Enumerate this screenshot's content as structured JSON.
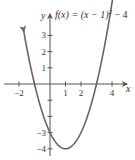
{
  "chart_data": {
    "type": "line",
    "title_parts": {
      "fx": "f(x) = (x − 1)",
      "exp": "2",
      "rest": " − 4"
    },
    "function": "(x - 1)^2 - 4",
    "xlabel": "x",
    "ylabel": "y",
    "x_ticks": [
      -2,
      1,
      2,
      4
    ],
    "x_tick_labels": [
      "−2",
      "1",
      "2",
      "4"
    ],
    "x_tick_marks": [
      -2,
      -1,
      1,
      2,
      3,
      4
    ],
    "y_ticks": [
      3,
      2,
      1,
      -3,
      -4
    ],
    "y_tick_labels": [
      "3",
      "2",
      "1",
      "−3",
      "−4"
    ],
    "y_tick_marks": [
      3,
      2,
      1,
      -1,
      -2,
      -3,
      -4
    ],
    "xlim": [
      -3,
      5
    ],
    "ylim": [
      -4.5,
      4.5
    ],
    "domain_plotted": [
      -1.7,
      4.7
    ],
    "vertex": [
      1,
      -4
    ],
    "y_intercept": [
      0,
      -3
    ],
    "x_intercepts": [
      -1,
      3
    ],
    "grid": false,
    "curve_color": "#666666",
    "axis_color": "#555555"
  }
}
